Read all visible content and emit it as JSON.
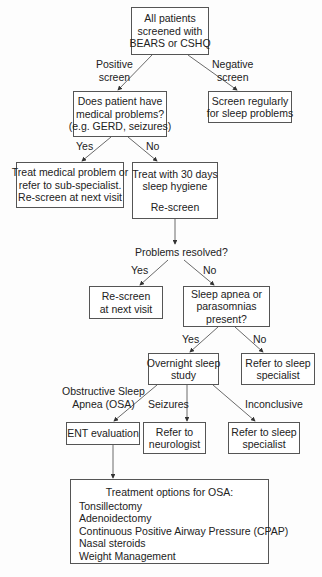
{
  "nodes": {
    "start": {
      "lines": [
        "All patients",
        "screened with",
        "BEARS or CSHQ"
      ]
    },
    "medical_q": {
      "lines": [
        "Does patient have",
        "medical problems?",
        "(e.g. GERD, seizures)"
      ]
    },
    "screen_regularly": {
      "lines": [
        "Screen regularly",
        "for sleep problems"
      ]
    },
    "treat_medical": {
      "lines": [
        "Treat medical problem or",
        "refer to sub-specialist.",
        "Re-screen at next visit"
      ]
    },
    "sleep_hygiene": {
      "lines": [
        "Treat with 30 days",
        "sleep hygiene",
        "",
        "Re-screen"
      ]
    },
    "problems_resolved": {
      "text": "Problems resolved?"
    },
    "rescreen_next": {
      "lines": [
        "Re-screen",
        "at next visit"
      ]
    },
    "apnea_q": {
      "lines": [
        "Sleep apnea or",
        "parasomnias",
        "present?"
      ]
    },
    "overnight_study": {
      "lines": [
        "Overnight sleep",
        "study"
      ]
    },
    "refer_specialist_1": {
      "lines": [
        "Refer to sleep",
        "specialist"
      ]
    },
    "ent": {
      "lines": [
        "ENT evaluation"
      ]
    },
    "neurologist": {
      "lines": [
        "Refer to",
        "neurologist"
      ]
    },
    "refer_specialist_2": {
      "lines": [
        "Refer to sleep",
        "specialist"
      ]
    },
    "treatment": {
      "title": "Treatment options for OSA:",
      "items": [
        "Tonsillectomy",
        "Adenoidectomy",
        "Continuous Positive Airway Pressure (CPAP)",
        "Nasal steroids",
        "Weight Management"
      ]
    }
  },
  "edge_labels": {
    "positive": [
      "Positive",
      "screen"
    ],
    "negative": [
      "Negative",
      "screen"
    ],
    "yes1": "Yes",
    "no1": "No",
    "yes2": "Yes",
    "no2": "No",
    "yes3": "Yes",
    "no3": "No",
    "osa": [
      "Obstructive Sleep",
      "Apnea (OSA)"
    ],
    "seizures": "Seizures",
    "inconclusive": "Inconclusive"
  },
  "colors": {
    "line": "#444444",
    "border": "#555555"
  }
}
